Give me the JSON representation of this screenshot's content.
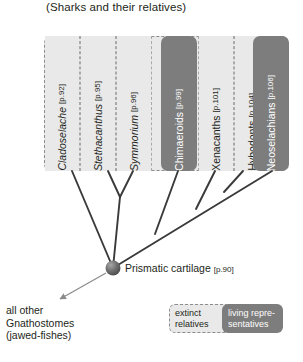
{
  "title": "(Sharks and their relatives)",
  "taxa": [
    {
      "name": "Cladoselache",
      "page": "[p.92]",
      "status": "extinct",
      "italic": true,
      "x": 44,
      "w": 36
    },
    {
      "name": "Stethacanthus",
      "page": "[p.95]",
      "status": "extinct",
      "italic": true,
      "x": 80,
      "w": 36
    },
    {
      "name": "Symmorium",
      "page": "[p.96]",
      "status": "extinct",
      "italic": true,
      "x": 116,
      "w": 36
    },
    {
      "name": "Chimaeroids",
      "page": "[p.99]",
      "status": "living",
      "italic": false,
      "x": 152,
      "w": 36
    },
    {
      "name": "Xenacanths",
      "page": "[p.101]",
      "status": "extinct",
      "italic": false,
      "x": 188,
      "w": 36
    },
    {
      "name": "Hybodonts",
      "page": "[p.104]",
      "status": "extinct",
      "italic": false,
      "x": 217,
      "w": 36
    },
    {
      "name": "Neoselachians",
      "page": "[p.106]",
      "status": "living",
      "italic": false,
      "x": 253,
      "w": 36
    }
  ],
  "node": {
    "label": "Prismatic cartilage",
    "page": "[p.90]"
  },
  "outgroup": {
    "line1": "all other",
    "line2": "Gnathostomes",
    "line3": "(jawed-fishes)"
  },
  "legend": {
    "extinct_line1": "extinct",
    "extinct_line2": "relatives",
    "living_line1": "living repre-",
    "living_line2": "sentatives"
  },
  "colors": {
    "extinct_fill": "#e9e9e9",
    "living_fill": "#7d7d7d",
    "dash_border": "#8d8d8d",
    "branch": "#3a3a3a",
    "text": "#231f20",
    "node_fill": "#6e6e6e"
  },
  "tree_geometry": {
    "root": {
      "x": 113,
      "y": 268
    },
    "tips": [
      72,
      108,
      133,
      178,
      215,
      243,
      272
    ],
    "tip_y": 171
  }
}
